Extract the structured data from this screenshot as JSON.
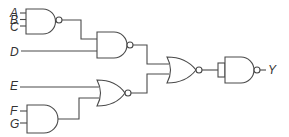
{
  "diagram": {
    "type": "logic-circuit",
    "inputs": {
      "A": "A",
      "B": "B",
      "C": "C",
      "D": "D",
      "E": "E",
      "F": "F",
      "G": "G"
    },
    "output": "Y",
    "gates": [
      {
        "id": "g1",
        "type": "NAND",
        "inputs": [
          "A",
          "B",
          "C"
        ]
      },
      {
        "id": "g2",
        "type": "NAND",
        "inputs": [
          "g1",
          "D"
        ]
      },
      {
        "id": "g3",
        "type": "AND",
        "inputs": [
          "F",
          "G"
        ]
      },
      {
        "id": "g4",
        "type": "NOR",
        "inputs": [
          "E",
          "g3"
        ]
      },
      {
        "id": "g5",
        "type": "NOR",
        "inputs": [
          "g2",
          "g4"
        ]
      },
      {
        "id": "g6",
        "type": "NAND",
        "inputs": [
          "g5"
        ],
        "output": "Y"
      }
    ],
    "colors": {
      "stroke": "#4a4a4a",
      "label": "#333333",
      "background": "#ffffff"
    }
  }
}
